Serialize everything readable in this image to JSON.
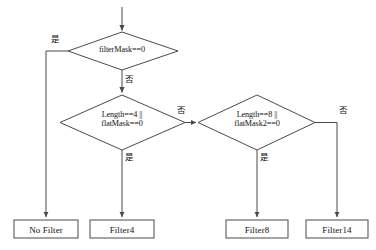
{
  "diagram": {
    "type": "flowchart",
    "title": "",
    "orientation": "top-down",
    "decisions": [
      {
        "id": "d1",
        "line1": "filterMask==0",
        "line2": "",
        "yes_label": "是",
        "no_label": "否"
      },
      {
        "id": "d2",
        "line1": "Length==4 ||",
        "line2": "flatMask==0",
        "yes_label": "是",
        "no_label": "否"
      },
      {
        "id": "d3",
        "line1": "Length==8 ||",
        "line2": "flatMask2==0",
        "yes_label": "是",
        "no_label": "否"
      }
    ],
    "terminals": [
      {
        "id": "t1",
        "label": "No Filter"
      },
      {
        "id": "t2",
        "label": "Filter4"
      },
      {
        "id": "t3",
        "label": "Filter8"
      },
      {
        "id": "t4",
        "label": "Filter14"
      }
    ],
    "edge_labels": {
      "d1_yes": "是",
      "d1_no": "否",
      "d2_yes": "是",
      "d2_no": "否",
      "d3_yes": "是",
      "d3_no": "否"
    },
    "colors": {
      "stroke": "#4a4a4a",
      "text": "#111111",
      "background": "#ffffff"
    }
  }
}
